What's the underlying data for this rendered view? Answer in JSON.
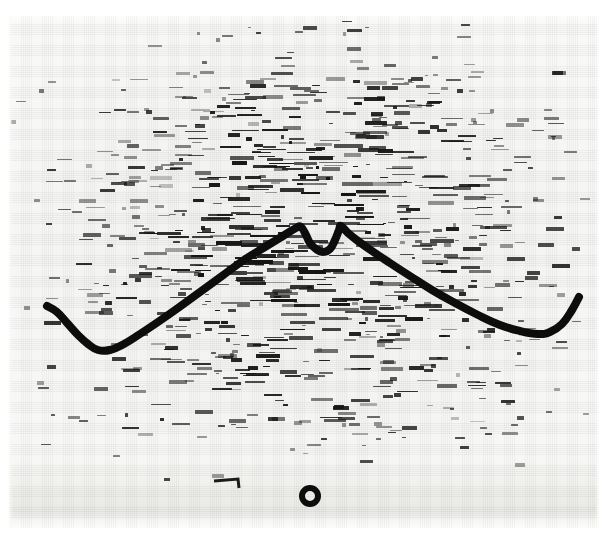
{
  "figure": {
    "width": 605,
    "height": 539,
    "media": "grayscale scanned film / photographic print",
    "background_color": "#f7f7f5",
    "ink_color": "#0d0d0d",
    "dash_color": "#151515"
  },
  "chart_data": {
    "type": "line",
    "xlabel": "",
    "ylabel": "",
    "xlim": [
      0,
      605
    ],
    "ylim": [
      539,
      0
    ],
    "grid": false,
    "legend": null,
    "note": "Pixel coordinates read directly off the scan; y increases downward.",
    "series": [
      {
        "name": "hand-drawn contour",
        "stroke_width": 8,
        "color": "#0d0d0d",
        "points": [
          [
            47,
            306
          ],
          [
            57,
            312
          ],
          [
            68,
            324
          ],
          [
            78,
            335
          ],
          [
            88,
            344
          ],
          [
            98,
            350
          ],
          [
            110,
            350
          ],
          [
            124,
            344
          ],
          [
            140,
            334
          ],
          [
            158,
            322
          ],
          [
            178,
            308
          ],
          [
            200,
            292
          ],
          [
            222,
            276
          ],
          [
            244,
            260
          ],
          [
            265,
            247
          ],
          [
            283,
            236
          ],
          [
            296,
            228
          ],
          [
            301,
            227
          ],
          [
            306,
            235
          ],
          [
            310,
            243
          ],
          [
            316,
            249
          ],
          [
            323,
            252
          ],
          [
            330,
            249
          ],
          [
            335,
            240
          ],
          [
            339,
            230
          ],
          [
            341,
            226
          ],
          [
            348,
            233
          ],
          [
            358,
            241
          ],
          [
            372,
            251
          ],
          [
            390,
            263
          ],
          [
            410,
            276
          ],
          [
            432,
            290
          ],
          [
            455,
            303
          ],
          [
            478,
            315
          ],
          [
            500,
            325
          ],
          [
            520,
            331
          ],
          [
            538,
            334
          ],
          [
            550,
            332
          ],
          [
            562,
            324
          ],
          [
            572,
            310
          ],
          [
            579,
            297
          ]
        ]
      }
    ],
    "annotations": [
      {
        "name": "circle-mark",
        "shape": "ring",
        "cx": 310,
        "cy": 496,
        "outer_diameter": 22,
        "stroke_width": 6,
        "color": "#0d0d0d"
      },
      {
        "name": "hook-mark",
        "shape": "polyline",
        "points": [
          [
            214,
            481
          ],
          [
            238,
            479
          ],
          [
            239,
            488
          ]
        ],
        "stroke_width": 3,
        "color": "#1a1a1a"
      }
    ],
    "background_texture": {
      "kind": "horizontal-dash-field",
      "description": "Dense field of short dark horizontal dashes of varying length and opacity, simulating degraded banded text lines on film.",
      "density_peak_x": 300,
      "density_peak_y": 240,
      "dash_count": 1560,
      "dash_length_range_px": [
        3,
        34
      ],
      "dash_height_range_px": [
        1,
        4
      ]
    }
  }
}
